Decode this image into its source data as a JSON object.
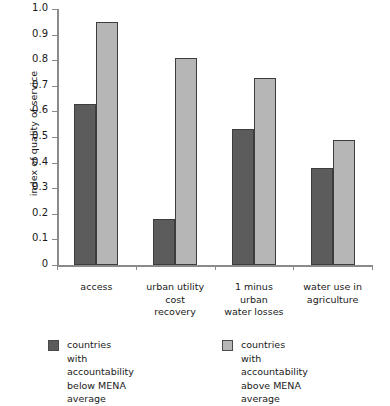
{
  "chart_data": {
    "type": "bar",
    "title": "",
    "xlabel": "",
    "ylabel": "index of quality of service",
    "ylim": [
      0,
      1.0
    ],
    "grid": false,
    "legend_position": "bottom",
    "categories": [
      "access",
      "urban utility\ncost\nrecovery",
      "1 minus\nurban\nwater losses",
      "water use in\nagriculture"
    ],
    "ytick_labels": [
      "1.0",
      "0.9",
      "0.8",
      "0.7",
      "0.6",
      "0.5",
      "0.4",
      "0.3",
      "0.2",
      "0.1",
      "0"
    ],
    "ytick_values": [
      1.0,
      0.9,
      0.8,
      0.7,
      0.6,
      0.5,
      0.4,
      0.3,
      0.2,
      0.1,
      0
    ],
    "series": [
      {
        "name": "countries with accountability\nbelow MENA average",
        "color": "#5c5c5c",
        "values": [
          0.63,
          0.18,
          0.53,
          0.38
        ]
      },
      {
        "name": "countries with accountability\nabove MENA average",
        "color": "#b6b6b6",
        "values": [
          0.95,
          0.81,
          0.73,
          0.49
        ]
      }
    ]
  },
  "legend": {
    "entries": [
      {
        "label": "countries with accountability\nbelow MENA average",
        "swatch": "dark-gray-swatch"
      },
      {
        "label": "countries with accountability\nabove MENA average",
        "swatch": "light-gray-swatch"
      }
    ]
  }
}
